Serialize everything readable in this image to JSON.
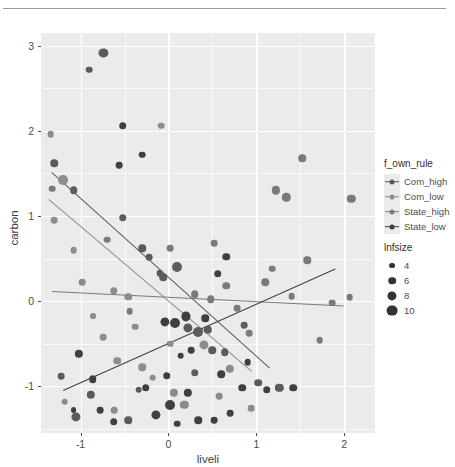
{
  "window": {
    "divider": true
  },
  "chart_data": {
    "type": "scatter",
    "title": "",
    "xlabel": "liveli",
    "ylabel": "carbon",
    "xlim": [
      -1.45,
      2.35
    ],
    "ylim": [
      -1.55,
      3.15
    ],
    "xticks": [
      -1,
      0,
      1,
      2
    ],
    "xtick_labels": [
      "-1",
      "0",
      "1",
      "2"
    ],
    "yticks": [
      -1,
      0,
      1,
      2,
      3
    ],
    "ytick_labels": [
      "-1",
      "0",
      "1",
      "2",
      "3"
    ],
    "xminor": [
      -1.5,
      -0.5,
      0.5,
      1.5,
      2.5
    ],
    "yminor": [
      -1.5,
      -0.5,
      0.5,
      1.5,
      2.5
    ],
    "grid": true,
    "panel_background": "#ebebeb",
    "gridline_color": "#ffffff",
    "legend_position": "right",
    "colour_legend": {
      "title": "f_own_rule",
      "entries": [
        {
          "label": "Com_high",
          "color": "#5b5b5b"
        },
        {
          "label": "Com_low",
          "color": "#8c8c8c"
        },
        {
          "label": "State_high",
          "color": "#7a7a7a"
        },
        {
          "label": "State_low",
          "color": "#3f3f3f"
        }
      ]
    },
    "size_legend": {
      "title": "lnfsize",
      "entries": [
        {
          "label": "4",
          "size": 4
        },
        {
          "label": "6",
          "size": 6
        },
        {
          "label": "8",
          "size": 8
        },
        {
          "label": "10",
          "size": 10
        }
      ]
    },
    "series": [
      {
        "name": "Com_high",
        "color": "#5b5b5b",
        "fit": {
          "x0": -1.33,
          "y0": 1.52,
          "x1": 1.15,
          "y1": -0.78
        },
        "points": [
          {
            "x": -1.3,
            "y": 1.62,
            "s": 6
          },
          {
            "x": -1.08,
            "y": 1.3,
            "s": 6
          },
          {
            "x": -0.74,
            "y": 2.92,
            "s": 8
          },
          {
            "x": -0.9,
            "y": 2.72,
            "s": 5
          },
          {
            "x": -0.52,
            "y": 0.98,
            "s": 6
          },
          {
            "x": -0.3,
            "y": 0.62,
            "s": 6
          },
          {
            "x": -0.22,
            "y": 0.52,
            "s": 5
          },
          {
            "x": -0.1,
            "y": 0.33,
            "s": 5
          },
          {
            "x": 0.1,
            "y": 0.4,
            "s": 9
          },
          {
            "x": -0.06,
            "y": 0.28,
            "s": 6
          },
          {
            "x": 0.22,
            "y": -0.32,
            "s": 8
          },
          {
            "x": 0.34,
            "y": -0.36,
            "s": 9
          },
          {
            "x": 0.45,
            "y": -0.34,
            "s": 7
          },
          {
            "x": 0.5,
            "y": -0.58,
            "s": 6
          },
          {
            "x": 0.64,
            "y": -0.6,
            "s": 6
          },
          {
            "x": 0.3,
            "y": -0.84,
            "s": 6
          },
          {
            "x": 0.86,
            "y": -0.28,
            "s": 5
          },
          {
            "x": 1.02,
            "y": -0.96,
            "s": 6
          },
          {
            "x": 1.26,
            "y": -1.02,
            "s": 7
          },
          {
            "x": -1.22,
            "y": -0.88,
            "s": 5
          },
          {
            "x": -0.88,
            "y": -1.1,
            "s": 7
          },
          {
            "x": -1.05,
            "y": -1.36,
            "s": 8
          },
          {
            "x": -0.46,
            "y": -1.4,
            "s": 6
          },
          {
            "x": -0.34,
            "y": -1.04,
            "s": 5
          }
        ]
      },
      {
        "name": "Com_low",
        "color": "#8c8c8c",
        "fit": {
          "x0": -1.36,
          "y0": 1.2,
          "x1": 0.95,
          "y1": -0.82
        },
        "points": [
          {
            "x": -1.34,
            "y": 1.96,
            "s": 5
          },
          {
            "x": -1.3,
            "y": 0.95,
            "s": 5
          },
          {
            "x": -1.2,
            "y": 1.42,
            "s": 9
          },
          {
            "x": -1.08,
            "y": 0.6,
            "s": 5
          },
          {
            "x": -0.98,
            "y": 0.22,
            "s": 5
          },
          {
            "x": -0.86,
            "y": -0.18,
            "s": 4
          },
          {
            "x": -0.74,
            "y": -0.42,
            "s": 5
          },
          {
            "x": -0.62,
            "y": 0.12,
            "s": 6
          },
          {
            "x": -0.46,
            "y": 0.05,
            "s": 6
          },
          {
            "x": -0.38,
            "y": -0.3,
            "s": 5
          },
          {
            "x": -0.58,
            "y": -0.7,
            "s": 6
          },
          {
            "x": -0.3,
            "y": -0.78,
            "s": 6
          },
          {
            "x": -0.18,
            "y": -0.9,
            "s": 5
          },
          {
            "x": 0.02,
            "y": -0.5,
            "s": 5
          },
          {
            "x": 0.06,
            "y": -1.08,
            "s": 7
          },
          {
            "x": 0.18,
            "y": -1.22,
            "s": 7
          },
          {
            "x": 0.4,
            "y": -0.52,
            "s": 8
          },
          {
            "x": 0.58,
            "y": -1.12,
            "s": 5
          },
          {
            "x": 0.7,
            "y": -0.8,
            "s": 7
          },
          {
            "x": 0.94,
            "y": -1.26,
            "s": 5
          },
          {
            "x": -0.62,
            "y": -1.28,
            "s": 5
          },
          {
            "x": -1.18,
            "y": -1.18,
            "s": 5
          },
          {
            "x": -0.08,
            "y": 2.06,
            "s": 5
          }
        ]
      },
      {
        "name": "State_high",
        "color": "#7a7a7a",
        "fit": {
          "x0": -1.32,
          "y0": 0.12,
          "x1": 2.0,
          "y1": -0.05
        },
        "points": [
          {
            "x": -1.32,
            "y": 1.32,
            "s": 5
          },
          {
            "x": -0.7,
            "y": 0.72,
            "s": 5
          },
          {
            "x": 0.02,
            "y": 0.62,
            "s": 5
          },
          {
            "x": 0.3,
            "y": 0.08,
            "s": 6
          },
          {
            "x": 0.48,
            "y": 0.02,
            "s": 6
          },
          {
            "x": 0.66,
            "y": 0.18,
            "s": 6
          },
          {
            "x": 0.78,
            "y": -0.08,
            "s": 5
          },
          {
            "x": 0.92,
            "y": -0.38,
            "s": 5
          },
          {
            "x": 1.1,
            "y": 0.22,
            "s": 6
          },
          {
            "x": 1.18,
            "y": 0.38,
            "s": 5
          },
          {
            "x": 1.4,
            "y": 0.06,
            "s": 5
          },
          {
            "x": 1.58,
            "y": 0.48,
            "s": 6
          },
          {
            "x": 1.72,
            "y": -0.46,
            "s": 5
          },
          {
            "x": 1.86,
            "y": -0.02,
            "s": 5
          },
          {
            "x": 2.06,
            "y": 0.05,
            "s": 5
          },
          {
            "x": 1.22,
            "y": 1.3,
            "s": 7
          },
          {
            "x": 1.34,
            "y": 1.22,
            "s": 7
          },
          {
            "x": 1.52,
            "y": 1.68,
            "s": 6
          },
          {
            "x": 2.08,
            "y": 1.2,
            "s": 7
          },
          {
            "x": 0.52,
            "y": 0.68,
            "s": 5
          },
          {
            "x": -0.44,
            "y": -0.12,
            "s": 5
          }
        ]
      },
      {
        "name": "State_low",
        "color": "#3f3f3f",
        "fit": {
          "x0": -1.2,
          "y0": -1.05,
          "x1": 1.9,
          "y1": 0.38
        },
        "points": [
          {
            "x": -1.02,
            "y": -0.62,
            "s": 7
          },
          {
            "x": -0.62,
            "y": -1.42,
            "s": 6
          },
          {
            "x": -0.78,
            "y": -1.28,
            "s": 5
          },
          {
            "x": -1.08,
            "y": -1.28,
            "s": 4
          },
          {
            "x": -0.26,
            "y": -1.02,
            "s": 6
          },
          {
            "x": -0.14,
            "y": -1.34,
            "s": 8
          },
          {
            "x": -0.02,
            "y": -0.88,
            "s": 6
          },
          {
            "x": 0.1,
            "y": -1.44,
            "s": 5
          },
          {
            "x": 0.22,
            "y": -1.08,
            "s": 7
          },
          {
            "x": 0.02,
            "y": -1.22,
            "s": 9
          },
          {
            "x": 0.34,
            "y": -1.4,
            "s": 6
          },
          {
            "x": 0.52,
            "y": -1.4,
            "s": 5
          },
          {
            "x": 0.7,
            "y": -1.32,
            "s": 5
          },
          {
            "x": 0.14,
            "y": -0.64,
            "s": 5
          },
          {
            "x": 0.26,
            "y": -0.58,
            "s": 5
          },
          {
            "x": 0.08,
            "y": -0.26,
            "s": 9
          },
          {
            "x": -0.04,
            "y": -0.24,
            "s": 8
          },
          {
            "x": 0.2,
            "y": -0.18,
            "s": 8
          },
          {
            "x": 0.42,
            "y": -0.2,
            "s": 6
          },
          {
            "x": 0.84,
            "y": -1.02,
            "s": 6
          },
          {
            "x": 1.12,
            "y": -1.04,
            "s": 6
          },
          {
            "x": 1.42,
            "y": -1.02,
            "s": 6
          },
          {
            "x": 0.6,
            "y": -0.86,
            "s": 6
          },
          {
            "x": 0.9,
            "y": -0.72,
            "s": 5
          },
          {
            "x": -0.86,
            "y": -0.92,
            "s": 6
          },
          {
            "x": 0.56,
            "y": 0.32,
            "s": 6
          },
          {
            "x": 0.66,
            "y": 0.52,
            "s": 6
          },
          {
            "x": -0.52,
            "y": 2.06,
            "s": 6
          },
          {
            "x": -0.56,
            "y": 1.6,
            "s": 5
          },
          {
            "x": -0.3,
            "y": 1.72,
            "s": 5
          }
        ]
      }
    ]
  }
}
